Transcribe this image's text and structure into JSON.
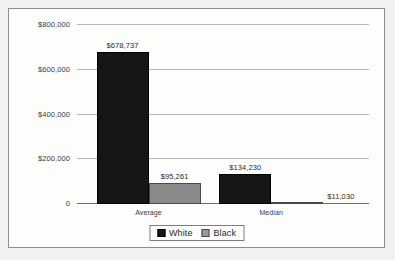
{
  "chart_data": {
    "type": "bar",
    "title": "",
    "xlabel": "",
    "ylabel": "",
    "categories": [
      "Average",
      "Median"
    ],
    "series": [
      {
        "name": "White",
        "color": "#161616",
        "values": [
          678737,
          134230
        ],
        "labels": [
          "$678,737",
          "$134,230"
        ]
      },
      {
        "name": "Black",
        "color": "#8a8a8a",
        "values": [
          95261,
          11030
        ],
        "labels": [
          "$95,261",
          "$11,030"
        ]
      }
    ],
    "ylim": [
      0,
      800000
    ],
    "yticks": [
      0,
      200000,
      400000,
      600000,
      800000
    ],
    "ytick_labels": [
      "0",
      "$200,000",
      "$400,000",
      "$600,000",
      "$800,000"
    ],
    "grid": true,
    "legend_position": "bottom"
  },
  "legend": {
    "items": [
      {
        "label": "White"
      },
      {
        "label": "Black"
      }
    ]
  }
}
